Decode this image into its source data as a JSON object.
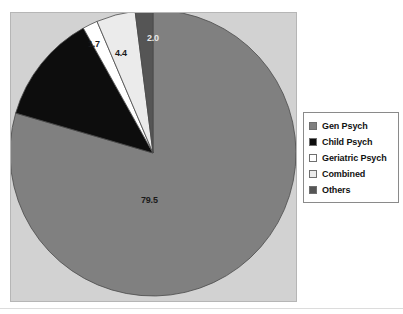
{
  "chart_data": {
    "type": "pie",
    "title": "",
    "subtitle": "",
    "xlabel": "",
    "ylabel": "",
    "grid": false,
    "legend_position": "right",
    "start_angle_deg": 90,
    "direction": "clockwise",
    "units": "percent",
    "categories": [
      "Gen Psych",
      "Child Psych",
      "Geriatric Psych",
      "Combined",
      "Others"
    ],
    "values": [
      79.5,
      12.4,
      1.7,
      4.4,
      2.0
    ],
    "data_labels": [
      "79.5",
      "",
      "1.7",
      "4.4",
      "2.0"
    ],
    "colors": [
      "#808080",
      "#0d0d0d",
      "#ffffff",
      "#ebebeb",
      "#555555"
    ],
    "slices": [
      {
        "label": "Gen Psych",
        "value": 79.5,
        "data_label": "79.5",
        "color": "#808080"
      },
      {
        "label": "Child Psych",
        "value": 12.4,
        "data_label": "",
        "color": "#0d0d0d"
      },
      {
        "label": "Geriatric Psych",
        "value": 1.7,
        "data_label": "1.7",
        "color": "#ffffff"
      },
      {
        "label": "Combined",
        "value": 4.4,
        "data_label": "4.4",
        "color": "#ebebeb"
      },
      {
        "label": "Others",
        "value": 2.0,
        "data_label": "2.0",
        "color": "#555555"
      }
    ]
  },
  "legend": {
    "items": [
      {
        "label": "Gen Psych",
        "color": "#808080"
      },
      {
        "label": "Child Psych",
        "color": "#0d0d0d"
      },
      {
        "label": "Geriatric Psych",
        "color": "#ffffff"
      },
      {
        "label": "Combined",
        "color": "#ebebeb"
      },
      {
        "label": "Others",
        "color": "#555555"
      }
    ]
  },
  "style": {
    "panel_background": "#d2d2d2",
    "panel_border": "#b6b6b6",
    "page_background": "#ffffff",
    "label_color": "#1a1a1a",
    "rule_color": "#dcdcdc"
  }
}
